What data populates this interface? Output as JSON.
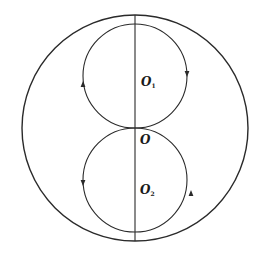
{
  "diagram": {
    "stroke_color": "#2a2a2a",
    "background": "#ffffff",
    "outer_circle": {
      "cx": 135,
      "cy": 126,
      "r": 113
    },
    "upper_circle": {
      "cx": 135,
      "cy": 76,
      "r": 52,
      "arrow_direction": "clockwise-right-down"
    },
    "lower_circle": {
      "cx": 135,
      "cy": 180,
      "r": 52,
      "arrow_direction": "counterclockwise-right-up"
    },
    "diameter_line": {
      "x": 135,
      "y1": 24,
      "y2": 233
    },
    "labels": {
      "center": {
        "main": "O",
        "sub": ""
      },
      "upper_center": {
        "main": "O",
        "sub": "1"
      },
      "lower_center": {
        "main": "O",
        "sub": "2"
      }
    }
  }
}
